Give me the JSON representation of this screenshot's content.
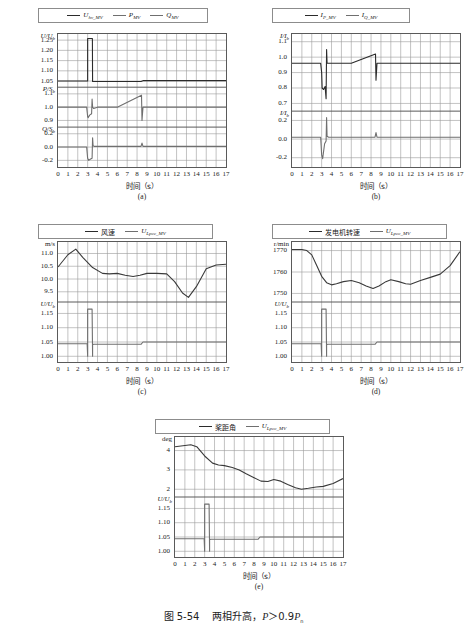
{
  "caption": {
    "number": "图 5-54",
    "text": "两相升高，",
    "condition_p": "P",
    "condition_gt": "＞",
    "condition_val": "0.9",
    "condition_pn": "P",
    "condition_pn_sub": "n"
  },
  "axis": {
    "x_title": "时间（s）",
    "x_ticks": [
      "0",
      "1",
      "2",
      "3",
      "4",
      "5",
      "6",
      "7",
      "8",
      "9",
      "10",
      "11",
      "12",
      "13",
      "14",
      "15",
      "16",
      "17"
    ]
  },
  "colors": {
    "line_dark": "#2b2b2b",
    "line_grey": "#7a7a7a",
    "grid": "#9a9a9a",
    "frame": "#5a5a5a"
  },
  "panels": [
    {
      "tag": "(a)",
      "legend": [
        {
          "label": "U",
          "sub": "hv_MV",
          "style": "dark"
        },
        {
          "label": "P",
          "sub": "MV",
          "style": "grey"
        },
        {
          "label": "Q",
          "sub": "MV",
          "style": "grey"
        }
      ],
      "subpanels": [
        {
          "ylabel": "U/U",
          "ylabel_sub": "b",
          "ticks": [
            "1.25",
            "1.20",
            "1.15",
            "1.10",
            "1.05"
          ]
        },
        {
          "ylabel": "P/S",
          "ylabel_sub": "b",
          "ticks": [
            "1.1",
            "1.0",
            "0.9"
          ]
        },
        {
          "ylabel": "Q/S",
          "ylabel_sub": "b",
          "ticks": [
            "0.2",
            "0.0",
            "-0.2"
          ]
        }
      ]
    },
    {
      "tag": "(b)",
      "legend": [
        {
          "label": "I",
          "sub": "P_MV",
          "style": "dark"
        },
        {
          "label": "I",
          "sub": "Q_MV",
          "style": "grey"
        }
      ],
      "subpanels": [
        {
          "ylabel": "I/I",
          "ylabel_sub": "b",
          "ticks": [
            "1.1",
            "1.0",
            "0.9",
            "0.8",
            "0.7"
          ]
        },
        {
          "ylabel": "I/I",
          "ylabel_sub": "b",
          "ticks": [
            "0.2",
            "0.0",
            "-0.2"
          ]
        }
      ]
    },
    {
      "tag": "(c)",
      "legend": [
        {
          "label": "风速",
          "sub": "",
          "style": "dark",
          "cn": true
        },
        {
          "label": "U",
          "sub": "Lpcc_MV",
          "style": "grey"
        }
      ],
      "subpanels": [
        {
          "ylabel": "m/s",
          "ylabel_sub": "",
          "unit": true,
          "ticks": [
            "11.0",
            "10.5",
            "10.0",
            "9.5"
          ]
        },
        {
          "ylabel": "U/U",
          "ylabel_sub": "b",
          "ticks": [
            "1.15",
            "1.10",
            "1.05",
            "1.00"
          ]
        }
      ]
    },
    {
      "tag": "(d)",
      "legend": [
        {
          "label": "发电机转速",
          "sub": "",
          "style": "dark",
          "cn": true
        },
        {
          "label": "U",
          "sub": "Lpcc_MV",
          "style": "grey"
        }
      ],
      "subpanels": [
        {
          "ylabel": "r/min",
          "ylabel_sub": "",
          "unit": true,
          "ticks": [
            "1770",
            "1760",
            "1750"
          ]
        },
        {
          "ylabel": "U/U",
          "ylabel_sub": "b",
          "ticks": [
            "1.15",
            "1.10",
            "1.05",
            "1.00"
          ]
        }
      ]
    },
    {
      "tag": "(e)",
      "legend": [
        {
          "label": "桨距角",
          "sub": "",
          "style": "dark",
          "cn": true
        },
        {
          "label": "U",
          "sub": "Lpcc_MV",
          "style": "grey"
        }
      ],
      "subpanels": [
        {
          "ylabel": "deg",
          "ylabel_sub": "",
          "unit": true,
          "ticks": [
            "4",
            "3",
            "2"
          ]
        },
        {
          "ylabel": "U/U",
          "ylabel_sub": "b",
          "ticks": [
            "1.15",
            "1.10",
            "1.05",
            "1.00"
          ]
        }
      ]
    }
  ],
  "chart_data": {
    "type": "line",
    "title": "两相升高，P＞0.9Pn",
    "xlabel": "时间（s）",
    "xlim": [
      0,
      17
    ],
    "grid": true,
    "legend_position": "top",
    "fault_window": {
      "start_s": 3.0,
      "end_s": 3.5,
      "recovery_event_s": 8.5
    },
    "subplots": [
      {
        "tag": "(a)",
        "stacked_axes": [
          {
            "ylabel": "U/Ub",
            "ylim": [
              1.02,
              1.28
            ],
            "yticks": [
              1.05,
              1.1,
              1.15,
              1.2,
              1.25
            ],
            "series": [
              {
                "name": "U_hv_MV",
                "color": "#2b2b2b",
                "x": [
                  0,
                  2.9,
                  3.0,
                  3.0,
                  3.48,
                  3.5,
                  4,
                  6,
                  8.4,
                  8.6,
                  12,
                  17
                ],
                "values": [
                  1.05,
                  1.05,
                  1.05,
                  1.258,
                  1.258,
                  1.048,
                  1.048,
                  1.048,
                  1.048,
                  1.052,
                  1.052,
                  1.052
                ]
              }
            ]
          },
          {
            "ylabel": "P/Sb",
            "ylim": [
              0.85,
              1.15
            ],
            "yticks": [
              0.9,
              1.0,
              1.1
            ],
            "series": [
              {
                "name": "P_MV",
                "color": "#6f6f6f",
                "x": [
                  0,
                  2.9,
                  3.0,
                  3.05,
                  3.2,
                  3.4,
                  3.45,
                  3.5,
                  3.6,
                  4,
                  6,
                  8.45,
                  8.5,
                  8.6,
                  12,
                  17
                ],
                "values": [
                  1.0,
                  1.0,
                  0.93,
                  0.92,
                  0.94,
                  0.95,
                  1.06,
                  1.0,
                  0.99,
                  1.0,
                  1.0,
                  1.09,
                  0.9,
                  1.0,
                  1.0,
                  1.0
                ]
              }
            ]
          },
          {
            "ylabel": "Q/Sb",
            "ylim": [
              -0.3,
              0.3
            ],
            "yticks": [
              -0.2,
              0.0,
              0.2
            ],
            "series": [
              {
                "name": "Q_MV",
                "color": "#6f6f6f",
                "x": [
                  0,
                  2.9,
                  3.0,
                  3.1,
                  3.3,
                  3.45,
                  3.5,
                  3.55,
                  3.7,
                  4,
                  8.4,
                  8.5,
                  8.6,
                  17
                ],
                "values": [
                  0.0,
                  0.0,
                  -0.17,
                  -0.2,
                  -0.18,
                  -0.17,
                  0.14,
                  0.02,
                  0.01,
                  0.01,
                  0.01,
                  0.06,
                  0.01,
                  0.01
                ]
              }
            ]
          }
        ]
      },
      {
        "tag": "(b)",
        "stacked_axes": [
          {
            "ylabel": "I/Ib",
            "ylim": [
              0.65,
              1.15
            ],
            "yticks": [
              0.7,
              0.8,
              0.9,
              1.0,
              1.1
            ],
            "series": [
              {
                "name": "I_P_MV",
                "color": "#2b2b2b",
                "x": [
                  0,
                  2.9,
                  3.0,
                  3.05,
                  3.2,
                  3.35,
                  3.45,
                  3.5,
                  3.55,
                  3.7,
                  4,
                  6,
                  8.45,
                  8.5,
                  8.6,
                  12,
                  17
                ],
                "values": [
                  0.96,
                  0.96,
                  0.9,
                  0.8,
                  0.79,
                  0.81,
                  0.73,
                  1.05,
                  0.96,
                  0.96,
                  0.96,
                  0.96,
                  1.02,
                  0.85,
                  0.96,
                  0.96,
                  0.96
                ]
              }
            ]
          },
          {
            "ylabel": "I/Ib",
            "ylim": [
              -0.3,
              0.3
            ],
            "yticks": [
              -0.2,
              0.0,
              0.2
            ],
            "series": [
              {
                "name": "I_Q_MV",
                "color": "#6f6f6f",
                "x": [
                  0,
                  2.9,
                  3.0,
                  3.1,
                  3.3,
                  3.45,
                  3.5,
                  3.55,
                  3.7,
                  4,
                  8.4,
                  8.5,
                  8.6,
                  17
                ],
                "values": [
                  0.02,
                  0.02,
                  -0.17,
                  -0.21,
                  -0.05,
                  -0.02,
                  0.23,
                  0.03,
                  0.02,
                  0.02,
                  0.02,
                  0.07,
                  0.02,
                  0.02
                ]
              }
            ]
          }
        ]
      },
      {
        "tag": "(c)",
        "stacked_axes": [
          {
            "ylabel": "m/s",
            "ylim": [
              9.1,
              11.45
            ],
            "yticks": [
              9.5,
              10.0,
              10.5,
              11.0
            ],
            "series": [
              {
                "name": "风速",
                "color": "#3a3a3a",
                "x": [
                  0,
                  1,
                  1.8,
                  2.5,
                  3.5,
                  4.5,
                  5.2,
                  6,
                  6.8,
                  7.6,
                  8.3,
                  9,
                  10,
                  11,
                  11.8,
                  12.6,
                  13.2,
                  14,
                  15,
                  16,
                  17
                ],
                "values": [
                  10.47,
                  10.95,
                  11.17,
                  10.85,
                  10.45,
                  10.22,
                  10.2,
                  10.22,
                  10.15,
                  10.1,
                  10.15,
                  10.22,
                  10.22,
                  10.2,
                  9.9,
                  9.45,
                  9.28,
                  9.7,
                  10.4,
                  10.55,
                  10.58
                ]
              }
            ]
          },
          {
            "ylabel": "U/Ub",
            "ylim": [
              0.98,
              1.19
            ],
            "yticks": [
              1.0,
              1.05,
              1.1,
              1.15
            ],
            "series": [
              {
                "name": "U_Lpcc_MV",
                "color": "#6f6f6f",
                "x": [
                  0,
                  2.95,
                  3.0,
                  3.0,
                  3.45,
                  3.5,
                  3.5,
                  3.6,
                  8.4,
                  8.6,
                  17
                ],
                "values": [
                  1.044,
                  1.044,
                  1.0,
                  1.165,
                  1.165,
                  1.0,
                  1.04,
                  1.042,
                  1.042,
                  1.05,
                  1.05
                ]
              }
            ]
          }
        ]
      },
      {
        "tag": "(d)",
        "stacked_axes": [
          {
            "ylabel": "r/min",
            "ylim": [
              1746,
              1774
            ],
            "yticks": [
              1750,
              1760,
              1770
            ],
            "series": [
              {
                "name": "发电机转速",
                "color": "#3a3a3a",
                "x": [
                  0,
                  1,
                  1.5,
                  2,
                  2.5,
                  3,
                  3.5,
                  4,
                  4.5,
                  5.2,
                  6,
                  6.8,
                  7.5,
                  8.2,
                  8.8,
                  9.5,
                  10,
                  10.8,
                  11.5,
                  12,
                  13,
                  14,
                  15,
                  16,
                  17
                ],
                "values": [
                  1770.5,
                  1770.5,
                  1770,
                  1768,
                  1763,
                  1758,
                  1755,
                  1754,
                  1754.5,
                  1755.5,
                  1756,
                  1755,
                  1753.5,
                  1752.3,
                  1753.5,
                  1755.5,
                  1756.4,
                  1755.5,
                  1754.5,
                  1754.3,
                  1756,
                  1757.5,
                  1759,
                  1763,
                  1769.5
                ]
              }
            ]
          },
          {
            "ylabel": "U/Ub",
            "ylim": [
              0.98,
              1.19
            ],
            "yticks": [
              1.0,
              1.05,
              1.1,
              1.15
            ],
            "series": [
              {
                "name": "U_Lpcc_MV",
                "color": "#6f6f6f",
                "x": [
                  0,
                  2.95,
                  3.0,
                  3.0,
                  3.45,
                  3.5,
                  3.5,
                  3.6,
                  8.4,
                  8.6,
                  17
                ],
                "values": [
                  1.044,
                  1.044,
                  1.0,
                  1.165,
                  1.165,
                  1.0,
                  1.04,
                  1.042,
                  1.042,
                  1.05,
                  1.05
                ]
              }
            ]
          }
        ]
      },
      {
        "tag": "(e)",
        "stacked_axes": [
          {
            "ylabel": "deg",
            "ylim": [
              1.6,
              4.7
            ],
            "yticks": [
              2,
              3,
              4
            ],
            "series": [
              {
                "name": "桨距角",
                "color": "#3a3a3a",
                "x": [
                  0,
                  0.8,
                  1.6,
                  2.2,
                  3,
                  3.8,
                  4.4,
                  5,
                  5.8,
                  6.5,
                  7.2,
                  8,
                  8.7,
                  9.4,
                  10,
                  10.7,
                  11.4,
                  12.2,
                  12.8,
                  13.5,
                  14.3,
                  15,
                  16,
                  17
                ],
                "values": [
                  4.2,
                  4.25,
                  4.3,
                  4.2,
                  3.72,
                  3.35,
                  3.25,
                  3.22,
                  3.12,
                  3.0,
                  2.8,
                  2.6,
                  2.42,
                  2.4,
                  2.5,
                  2.42,
                  2.25,
                  2.08,
                  2.0,
                  2.05,
                  2.12,
                  2.15,
                  2.3,
                  2.55
                ]
              }
            ]
          },
          {
            "ylabel": "U/Ub",
            "ylim": [
              0.98,
              1.19
            ],
            "yticks": [
              1.0,
              1.05,
              1.1,
              1.15
            ],
            "series": [
              {
                "name": "U_Lpcc_MV",
                "color": "#6f6f6f",
                "x": [
                  0,
                  2.95,
                  3.0,
                  3.0,
                  3.45,
                  3.5,
                  3.5,
                  3.6,
                  8.4,
                  8.6,
                  17
                ],
                "values": [
                  1.044,
                  1.044,
                  1.0,
                  1.165,
                  1.165,
                  1.0,
                  1.04,
                  1.042,
                  1.042,
                  1.05,
                  1.05
                ]
              }
            ]
          }
        ]
      }
    ]
  }
}
